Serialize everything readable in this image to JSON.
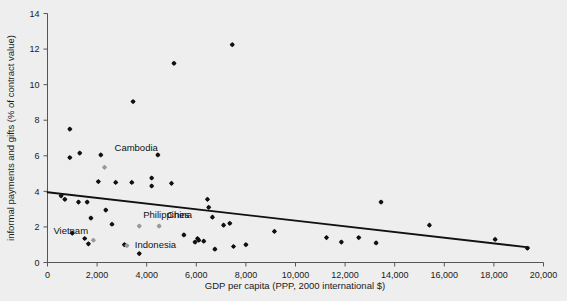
{
  "chart_data": {
    "type": "scatter",
    "title": "",
    "xlabel": "GDP per capita (PPP, 2000 international $)",
    "ylabel": "informal payments and gifts (% of contract value)",
    "xlim": [
      0,
      20000
    ],
    "ylim": [
      0,
      14
    ],
    "xticks": [
      0,
      2000,
      4000,
      6000,
      8000,
      10000,
      12000,
      14000,
      16000,
      18000,
      20000
    ],
    "xtick_labels": [
      "0",
      "2,000",
      "4,000",
      "6,000",
      "8,000",
      "10,000",
      "12,000",
      "14,000",
      "16,000",
      "18,000",
      "20,000"
    ],
    "yticks": [
      0,
      2,
      4,
      6,
      8,
      10,
      12,
      14
    ],
    "ytick_labels": [
      "0",
      "2",
      "4",
      "6",
      "8",
      "10",
      "12",
      "14"
    ],
    "grid": false,
    "legend": "none",
    "marker_color": "#111111",
    "highlight_color": "#999999",
    "trendline_color": "#111111",
    "background_color": "#eeeeee",
    "axis_color": "#555555",
    "trendline": {
      "x0": 0,
      "y0": 3.95,
      "x1": 19400,
      "y1": 0.85
    },
    "points": [
      {
        "x": 900,
        "y": 7.5
      },
      {
        "x": 1300,
        "y": 6.15
      },
      {
        "x": 2150,
        "y": 6.05
      },
      {
        "x": 3450,
        "y": 9.05
      },
      {
        "x": 4450,
        "y": 6.05
      },
      {
        "x": 5100,
        "y": 11.2
      },
      {
        "x": 7450,
        "y": 12.25
      },
      {
        "x": 900,
        "y": 5.9
      },
      {
        "x": 2050,
        "y": 4.55
      },
      {
        "x": 2750,
        "y": 4.5
      },
      {
        "x": 3400,
        "y": 4.5
      },
      {
        "x": 4200,
        "y": 4.75
      },
      {
        "x": 4200,
        "y": 4.3
      },
      {
        "x": 5000,
        "y": 4.45
      },
      {
        "x": 550,
        "y": 3.75
      },
      {
        "x": 700,
        "y": 3.55
      },
      {
        "x": 1250,
        "y": 3.4
      },
      {
        "x": 1600,
        "y": 3.4
      },
      {
        "x": 2350,
        "y": 2.95
      },
      {
        "x": 6450,
        "y": 3.55
      },
      {
        "x": 6500,
        "y": 3.1
      },
      {
        "x": 13450,
        "y": 3.4
      },
      {
        "x": 1750,
        "y": 2.5
      },
      {
        "x": 2600,
        "y": 2.15
      },
      {
        "x": 6650,
        "y": 2.55
      },
      {
        "x": 7100,
        "y": 2.1
      },
      {
        "x": 7350,
        "y": 2.2
      },
      {
        "x": 9150,
        "y": 1.75
      },
      {
        "x": 11250,
        "y": 1.4
      },
      {
        "x": 11850,
        "y": 1.15
      },
      {
        "x": 12550,
        "y": 1.4
      },
      {
        "x": 13250,
        "y": 1.1
      },
      {
        "x": 15400,
        "y": 2.1
      },
      {
        "x": 18050,
        "y": 1.3
      },
      {
        "x": 1000,
        "y": 1.65
      },
      {
        "x": 1500,
        "y": 1.35
      },
      {
        "x": 1650,
        "y": 1.05
      },
      {
        "x": 3100,
        "y": 1.0
      },
      {
        "x": 3700,
        "y": 0.5
      },
      {
        "x": 5500,
        "y": 1.55
      },
      {
        "x": 5950,
        "y": 1.15
      },
      {
        "x": 6050,
        "y": 1.35
      },
      {
        "x": 6100,
        "y": 1.25
      },
      {
        "x": 6300,
        "y": 1.2
      },
      {
        "x": 6750,
        "y": 0.75
      },
      {
        "x": 7500,
        "y": 0.9
      },
      {
        "x": 8000,
        "y": 1.0
      },
      {
        "x": 19350,
        "y": 0.8
      }
    ],
    "highlighted_points": [
      {
        "label": "Cambodia",
        "x": 2300,
        "y": 5.35,
        "label_dx": 10,
        "label_dy": -16
      },
      {
        "label": "Philippines",
        "x": 3700,
        "y": 2.05,
        "label_dx": 4,
        "label_dy": -8
      },
      {
        "label": "China",
        "x": 4500,
        "y": 2.05,
        "label_dx": 8,
        "label_dy": -8
      },
      {
        "label": "Vietnam",
        "x": 1850,
        "y": 1.25,
        "label_dx": -40,
        "label_dy": -6
      },
      {
        "label": "Indonesia",
        "x": 3200,
        "y": 0.95,
        "label_dx": 8,
        "label_dy": 2
      }
    ]
  }
}
